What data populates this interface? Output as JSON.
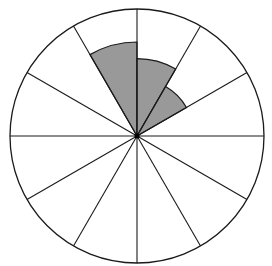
{
  "chart_data": {
    "type": "polar-area",
    "title": "",
    "sectors": 12,
    "sector_angle_deg": 30,
    "outer_radius": 1.0,
    "series": [
      {
        "name": "shaded",
        "color": "#999999",
        "segments": [
          {
            "start_deg": 90,
            "end_deg": 120,
            "radius": 0.74
          },
          {
            "start_deg": 60,
            "end_deg": 90,
            "radius": 0.61
          },
          {
            "start_deg": 30,
            "end_deg": 60,
            "radius": 0.45
          }
        ]
      }
    ],
    "grid": true,
    "legend": "none"
  },
  "style": {
    "line_color": "#1a1a1a",
    "fill_color": "#999999",
    "background": "#ffffff"
  }
}
